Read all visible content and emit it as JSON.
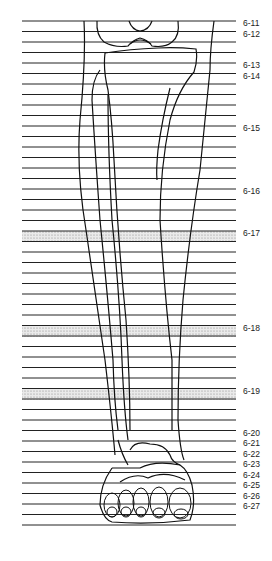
{
  "figure": {
    "line_count": 49,
    "line_start_y": 21,
    "line_spacing": 10.5,
    "line_x1": 22,
    "line_x2": 236,
    "shaded_bands": [
      {
        "label": "6-17",
        "y1": 231,
        "y2": 242
      },
      {
        "label": "6-18",
        "y1": 326,
        "y2": 337
      },
      {
        "label": "6-19",
        "y1": 389,
        "y2": 400
      }
    ],
    "labels": [
      {
        "text": "6-11",
        "y": 23
      },
      {
        "text": "6-12",
        "y": 34
      },
      {
        "text": "6-13",
        "y": 65
      },
      {
        "text": "6-14",
        "y": 76
      },
      {
        "text": "6-15",
        "y": 128
      },
      {
        "text": "6-16",
        "y": 191
      },
      {
        "text": "6-17",
        "y": 233
      },
      {
        "text": "6-18",
        "y": 328
      },
      {
        "text": "6-19",
        "y": 391
      },
      {
        "text": "6-20",
        "y": 433
      },
      {
        "text": "6-21",
        "y": 443
      },
      {
        "text": "6-22",
        "y": 454
      },
      {
        "text": "6-23",
        "y": 464
      },
      {
        "text": "6-24",
        "y": 475
      },
      {
        "text": "6-25",
        "y": 485
      },
      {
        "text": "6-26",
        "y": 496
      },
      {
        "text": "6-27",
        "y": 506
      }
    ]
  }
}
